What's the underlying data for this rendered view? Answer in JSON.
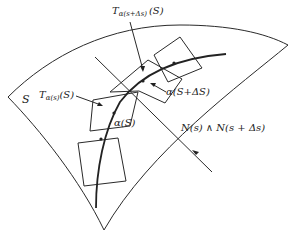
{
  "figure": {
    "type": "diagram",
    "labels": {
      "surface": "S",
      "tangent_plane_s": "T",
      "tangent_plane_s_sub": "α(s)",
      "tangent_plane_s_arg": "(S)",
      "tangent_plane_s_ds": "T",
      "tangent_plane_s_ds_sub": "α(s+Δs)",
      "tangent_plane_s_ds_arg": "(S)",
      "point_s": "α(S)",
      "point_s_ds": "α(S+ΔS)",
      "intersection_line": "N(s) ∧ N(s + Δs)"
    },
    "colors": {
      "ink": "#222222",
      "background": "#ffffff"
    }
  }
}
